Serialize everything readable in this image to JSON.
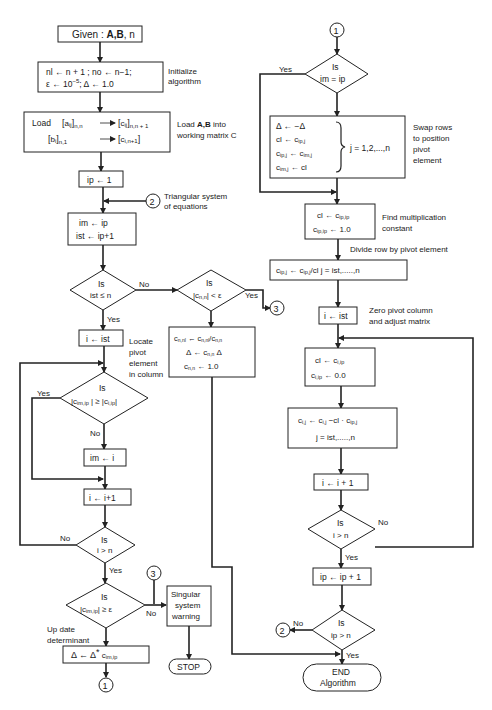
{
  "diagram": {
    "type": "flowchart",
    "left_column": {
      "start": {
        "given": "Given : ",
        "vars": "A,B",
        "n": ", n"
      },
      "init": {
        "line1": "nl ← n + 1 ; no ← n−1;",
        "line2_eps": "ε ← 10",
        "line2_exp": "−5",
        "line2_rest": "; Δ ← 1.0",
        "note1": "Initialize",
        "note2": "algorithm"
      },
      "load": {
        "line1_prefix": "Load",
        "a": "a",
        "a_sub": "ij",
        "a_dim": "n,n",
        "c": "c",
        "c_sub": "ij",
        "c_dim": "n,n + 1",
        "b": "b",
        "b_sub": "i",
        "b_dim": "n,1",
        "c2": "c",
        "c2_sub": "i,n+1",
        "note_prefix": "Load ",
        "note_bold": "A,B",
        "note_suffix": " into",
        "note2": "working matrix C"
      },
      "ip_init": "ip ← 1",
      "connector2_label": "2",
      "triangular_note1": "Triangular system",
      "triangular_note2": "of equations",
      "set_im": {
        "line1": "im ← ip",
        "line2": "ist ← ip+1"
      },
      "dec_ist": {
        "is": "Is",
        "cond": "ist ≤ n",
        "no": "No",
        "yes": "Yes"
      },
      "i_ist": "i ← ist",
      "locate_note": [
        "Locate",
        "pivot",
        "element",
        "in column"
      ],
      "dec_pivot": {
        "is": "Is",
        "cond_left": "|c",
        "cond_left_sub": "im,ip",
        "cond_mid": "| ≥ |c",
        "cond_right_sub": "i,ip",
        "cond_end": "|",
        "yes": "Yes",
        "no": "No"
      },
      "im_i": "im ← i",
      "i_inc": "i ← i+1",
      "dec_i_n": {
        "is": "Is",
        "cond": "i > n",
        "no": "No",
        "yes": "Yes"
      },
      "dec_eps": {
        "is": "Is",
        "cond_a": "|c",
        "cond_sub": "im,ip",
        "cond_b": "| ≥ ε",
        "no": "No"
      },
      "update_note1": "Up date",
      "update_note2": "determinant",
      "update": {
        "a": "Δ ← Δ",
        "star": "*",
        "c": " c",
        "sub": "im,ip"
      },
      "connector1_label": "1",
      "connector3_label": "3",
      "singular": [
        "Singular",
        "system",
        "warning"
      ],
      "stop": "STOP"
    },
    "middle_column": {
      "dec_cnn": {
        "is": "Is",
        "cond_a": "|c",
        "cond_sub": "n,n",
        "cond_b": "| < ε",
        "yes": "Yes"
      },
      "connector3_label": "3",
      "final": {
        "l1a": "c",
        "l1a_sub": "n,nl",
        "l1b": " ← c",
        "l1b_sub": "n,nl",
        "l1c": "/c",
        "l1c_sub": "n,n",
        "l2a": "Δ ← c",
        "l2_sub": "n,n",
        "l2b": " Δ",
        "l3a": "c",
        "l3_sub": "n,n",
        "l3b": " ← 1.0"
      }
    },
    "right_column": {
      "connector1_label": "1",
      "dec_im_ip": {
        "is": "Is",
        "cond": "im = ip",
        "yes": "Yes"
      },
      "swap": {
        "l1": "Δ ← −Δ",
        "l2a": "cl ← c",
        "l2_sub": "ip,j",
        "l3a": "c",
        "l3_sub1": "ip,j",
        "l3b": " ← c",
        "l3_sub2": "im,j",
        "l4a": "c",
        "l4_sub": "im,j",
        "l4b": " ← cl",
        "range": "j = 1,2,...,n",
        "note": [
          "Swap rows",
          "to position",
          "pivot",
          "element"
        ]
      },
      "mult": {
        "l1a": "cl ← c",
        "l1_sub": "ip,ip",
        "l2a": "c",
        "l2_sub": "ip,ip",
        "l2b": " ← 1.0",
        "note": [
          "Find multiplication",
          "constant"
        ]
      },
      "divide_note": "Divide row by pivot element",
      "divide": {
        "a": "c",
        "a_sub": "ip,j",
        "b": " ← c",
        "b_sub": "ip,j",
        "c": "/cl   j = ist,.....,n"
      },
      "i_ist": "i ← ist",
      "zero_note": [
        "Zero pivot column",
        "and adjust matrix"
      ],
      "zero": {
        "l1a": "cl ← c",
        "l1_sub": "i,ip",
        "l2a": "c",
        "l2_sub": "i,ip",
        "l2b": " ← 0.0"
      },
      "adjust": {
        "l1a": "c",
        "l1_sub": "i,j",
        "l1b": " ← c",
        "l1_sub2": "i,j",
        "l1c": " −cl · c",
        "l1_sub3": "ip,j",
        "l2": "j = ist,.....,n"
      },
      "i_inc": "i ← i + 1",
      "dec_i_n": {
        "is": "Is",
        "cond": "i > n",
        "no": "No",
        "yes": "Yes"
      },
      "ip_inc": "ip ← ip + 1",
      "dec_ip_n": {
        "is": "Is",
        "cond": "ip > n",
        "no": "No",
        "yes": "Yes"
      },
      "connector2_label": "2",
      "end": [
        "END",
        "Algorithm"
      ]
    }
  }
}
